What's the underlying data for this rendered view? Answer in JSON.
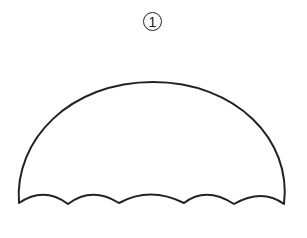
{
  "figure": {
    "label": "1",
    "shape": "umbrella-canopy",
    "stroke_color": "#222222",
    "fill_color": "#ffffff"
  }
}
